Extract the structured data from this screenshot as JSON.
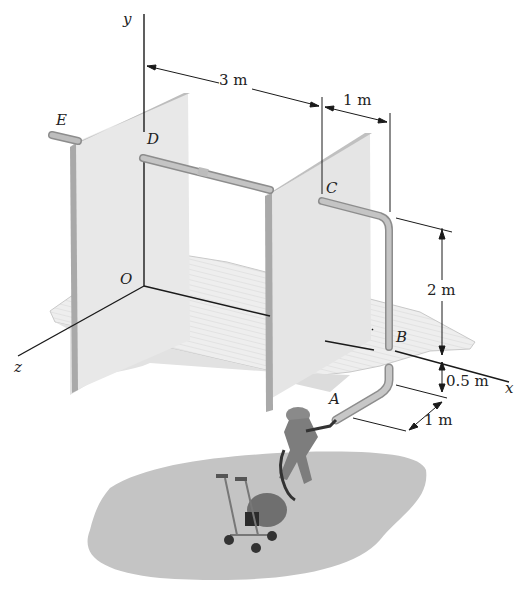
{
  "figure": {
    "axes": {
      "x": "x",
      "y": "y",
      "z": "z",
      "origin": "O"
    },
    "points": {
      "A": "A",
      "B": "B",
      "C": "C",
      "D": "D",
      "E": "E"
    },
    "dimensions": {
      "d_3m": "3 m",
      "d_1m_top": "1 m",
      "d_2m": "2 m",
      "d_05m": "0.5 m",
      "d_1m_bottom": "1 m"
    },
    "colors": {
      "panel": "#e6e6e6",
      "panel_edge": "#a9a9a9",
      "pipe": "#b8b8b8",
      "floor": "#ececec",
      "ground": "#bdbdbd",
      "lines": "#1a1a1a"
    }
  }
}
